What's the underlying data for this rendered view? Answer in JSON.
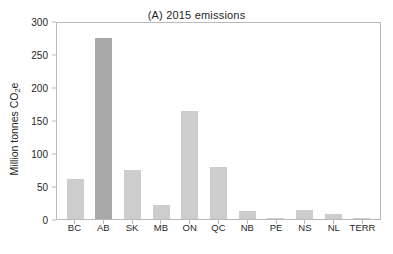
{
  "chart_data": {
    "type": "bar",
    "title": "(A) 2015 emissions",
    "xlabel": "",
    "ylabel": "Million tonnes CO2e",
    "ylabel_prefix": "Million tonnes CO",
    "ylabel_subscript": "2",
    "ylabel_suffix": "e",
    "categories": [
      "BC",
      "AB",
      "SK",
      "MB",
      "ON",
      "QC",
      "NB",
      "PE",
      "NS",
      "NL",
      "TERR"
    ],
    "values": [
      61,
      274,
      74,
      21,
      164,
      79,
      12,
      1.8,
      13,
      8,
      1.5
    ],
    "ylim": [
      0,
      300
    ],
    "yticks": [
      0,
      50,
      100,
      150,
      200,
      250,
      300
    ],
    "ytick_labels": [
      "0",
      "50",
      "100",
      "150",
      "200",
      "250",
      "300"
    ],
    "grid": false,
    "legend": "none",
    "bar_color": "#cdcdcd",
    "highlight_color": "#a8a8a8",
    "highlight_category": "AB",
    "axis_color": "#b9b9b9",
    "text_color": "#1f1f1f",
    "background": "#ffffff"
  }
}
